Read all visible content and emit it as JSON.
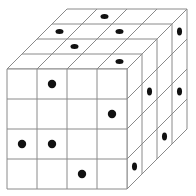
{
  "diagram": {
    "type": "cube-grid",
    "grid_size": 4,
    "colors": {
      "background": "#ffffff",
      "line": "#8a8a8a",
      "dot": "#111111"
    },
    "geometry": {
      "front_origin_x": 7,
      "front_origin_y": 69,
      "cell": 30,
      "depth_dx": 15,
      "depth_dy": -15,
      "dot_r_front": 4.2
    },
    "faces": {
      "front": {
        "dots": [
          {
            "row": 0,
            "col": 1
          },
          {
            "row": 1,
            "col": 3
          },
          {
            "row": 2,
            "col": 0
          },
          {
            "row": 2,
            "col": 1
          },
          {
            "row": 3,
            "col": 2
          }
        ]
      },
      "top": {
        "dots": [
          {
            "depth": 0,
            "col": 3
          },
          {
            "depth": 1,
            "col": 1
          },
          {
            "depth": 2,
            "col": 0
          },
          {
            "depth": 2,
            "col": 2
          },
          {
            "depth": 3,
            "col": 1
          }
        ]
      },
      "right": {
        "dots": [
          {
            "depth": 0,
            "row": 3
          },
          {
            "depth": 1,
            "row": 1
          },
          {
            "depth": 2,
            "row": 3
          },
          {
            "depth": 3,
            "row": 0
          },
          {
            "depth": 3,
            "row": 2
          }
        ]
      }
    }
  }
}
